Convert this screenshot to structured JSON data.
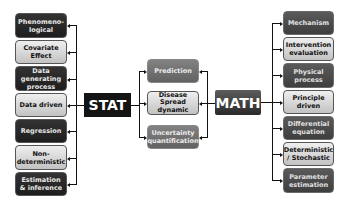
{
  "left_column": [
    {
      "label": "Phenomeno-\nlogical",
      "style": "dark"
    },
    {
      "label": "Covariate\nEffect",
      "style": "light"
    },
    {
      "label": "Data\ngenerating\nprocess",
      "style": "dark"
    },
    {
      "label": "Data driven",
      "style": "light"
    },
    {
      "label": "Regression",
      "style": "dark"
    },
    {
      "label": "Non-\ndeterministic",
      "style": "light"
    },
    {
      "label": "Estimation\n& inference",
      "style": "dark"
    }
  ],
  "hubs": {
    "stat": "STAT",
    "math": "MATH"
  },
  "center_column": [
    {
      "label": "Prediction",
      "style": "gray"
    },
    {
      "label": "Disease\nSpread\ndynamic",
      "style": "light"
    },
    {
      "label": "Uncertainty\nquantification",
      "style": "gray"
    }
  ],
  "right_column": [
    {
      "label": "Mechanism",
      "style": "mid"
    },
    {
      "label": "Intervention\nevaluation",
      "style": "light"
    },
    {
      "label": "Physical\nprocess",
      "style": "mid"
    },
    {
      "label": "Principle\ndriven",
      "style": "light"
    },
    {
      "label": "Differential\nequation",
      "style": "mid"
    },
    {
      "label": "Deterministic\n/ Stochastic",
      "style": "light"
    },
    {
      "label": "Parameter\nestimation",
      "style": "mid"
    }
  ],
  "colors": {
    "dark_box": "#262626",
    "mid_box": "#4a4a4a",
    "gray_box": "#707070",
    "light_box": "#d8d8d8",
    "stat_hub": "#141414",
    "math_hub": "#3c3c3c",
    "connector": "#111111"
  }
}
